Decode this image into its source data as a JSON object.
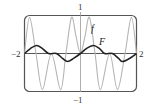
{
  "chart_data": {
    "type": "line",
    "title": "",
    "xlabel": "",
    "ylabel": "",
    "xlim": [
      -2,
      2
    ],
    "ylim": [
      -1,
      1
    ],
    "grid": false,
    "legend": "inline labels",
    "tick_labels": {
      "x_min": "−2",
      "x_max": "2",
      "y_max": "1",
      "y_min": "−1"
    },
    "series": [
      {
        "name": "f",
        "label": "f",
        "color": "#b5b5b5",
        "x": [
          -2.0,
          -1.82,
          -1.59,
          -1.36,
          -1.04,
          -0.71,
          -0.52,
          -0.32,
          -0.16,
          0.0,
          0.16,
          0.32,
          0.52,
          0.71,
          1.04,
          1.32,
          1.59,
          1.82,
          2.0
        ],
        "y": [
          0.0,
          0.95,
          0.0,
          -0.95,
          0.0,
          -0.95,
          0.0,
          0.95,
          0.45,
          0.0,
          0.45,
          0.95,
          0.0,
          -0.95,
          0.0,
          -0.95,
          0.0,
          0.95,
          0.0
        ]
      },
      {
        "name": "F",
        "label": "F",
        "color": "#222222",
        "x": [
          -2.0,
          -1.79,
          -1.57,
          -1.36,
          -1.14,
          -0.86,
          -0.64,
          -0.46,
          -0.25,
          0.0,
          0.21,
          0.46,
          0.68,
          0.86,
          1.14,
          1.36,
          1.5,
          1.75,
          2.0
        ],
        "y": [
          0.0,
          0.13,
          0.21,
          0.13,
          0.0,
          0.0,
          -0.13,
          -0.21,
          -0.13,
          0.0,
          0.13,
          0.21,
          0.13,
          0.0,
          0.0,
          -0.13,
          -0.21,
          -0.13,
          0.0
        ]
      }
    ]
  },
  "labels": {
    "f": "f",
    "F": "F",
    "x_min": "−2",
    "x_max": "2",
    "y_max": "1",
    "y_min": "−1"
  }
}
